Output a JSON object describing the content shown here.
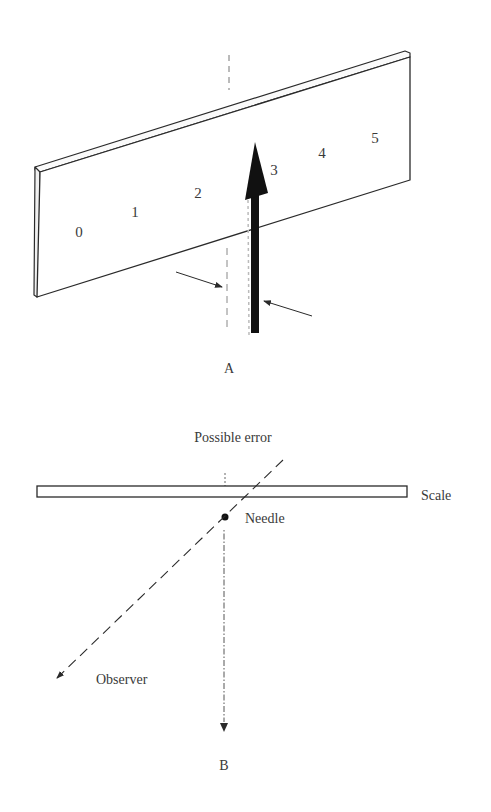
{
  "figure_a": {
    "label": "A",
    "scale_numbers": [
      "0",
      "1",
      "2",
      "3",
      "4",
      "5"
    ],
    "description": "Perspective view of meter scale with needle pointer and parallax viewing arrows"
  },
  "figure_b": {
    "label": "B",
    "labels": {
      "possible_error": "Possible error",
      "scale": "Scale",
      "needle": "Needle",
      "observer": "Observer"
    },
    "description": "Top view showing parallax error from oblique observer line of sight"
  },
  "colors": {
    "line": "#2a2a2a",
    "needle": "#111111",
    "text": "#3a3a3a",
    "background": "#ffffff"
  }
}
